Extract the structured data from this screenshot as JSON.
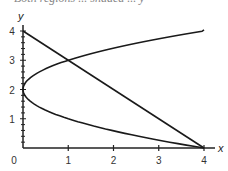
{
  "header_fragment": "Both regions ... shaded ... y",
  "chart_data": {
    "type": "line",
    "title": "",
    "xlabel": "x",
    "ylabel": "y",
    "xlim": [
      0,
      4
    ],
    "ylim": [
      0,
      4
    ],
    "xticks": [
      "0",
      "1",
      "2",
      "3",
      "4"
    ],
    "yticks": [
      "1",
      "2",
      "3",
      "4"
    ],
    "grid": false,
    "series": [
      {
        "name": "line x + y = 4",
        "x": [
          0,
          4
        ],
        "y": [
          4,
          0
        ]
      },
      {
        "name": "parabola x = (y-2)^2 upper branch",
        "x": [
          0,
          0.25,
          1,
          2.25,
          4
        ],
        "y": [
          2,
          2.5,
          3,
          3.5,
          4
        ]
      },
      {
        "name": "parabola x = (y-2)^2 lower branch",
        "x": [
          0,
          0.25,
          1,
          2.25,
          4
        ],
        "y": [
          2,
          1.5,
          1,
          0.5,
          0
        ]
      }
    ],
    "annotations": [
      "intersection at (1, 3)",
      "intersection at (4, 0)"
    ]
  }
}
